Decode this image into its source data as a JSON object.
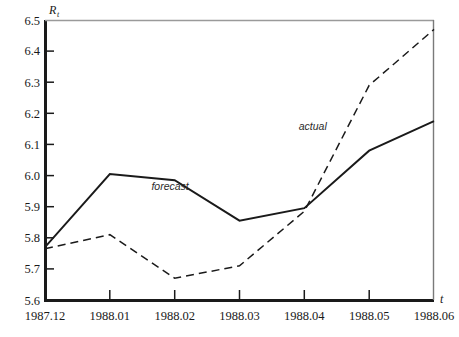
{
  "chart_data": {
    "type": "line",
    "title": "",
    "xlabel": "t",
    "ylabel": "R",
    "ylabel_sub": "t",
    "ylim": [
      5.6,
      6.5
    ],
    "ytick_step": 0.1,
    "grid": false,
    "legend_position": "inline-annotation",
    "categories": [
      "1987.12",
      "1988.01",
      "1988.02",
      "1988.03",
      "1988.04",
      "1988.05",
      "1988.06"
    ],
    "yticks": [
      "6.5",
      "6.4",
      "6.3",
      "6.2",
      "6.1",
      "6.0",
      "5.9",
      "5.8",
      "5.7",
      "5.6"
    ],
    "ytick_values": [
      6.5,
      6.4,
      6.3,
      6.2,
      6.1,
      6.0,
      5.9,
      5.8,
      5.7,
      5.6
    ],
    "series": [
      {
        "name": "forecast",
        "style": "solid",
        "color": "#1a1a1a",
        "values": [
          5.77,
          6.005,
          5.985,
          5.855,
          5.895,
          6.08,
          6.175
        ],
        "annotation": "forecast",
        "annotation_at": {
          "x": 1.93,
          "y": 5.955
        }
      },
      {
        "name": "actual",
        "style": "dashed",
        "color": "#1a1a1a",
        "values": [
          5.765,
          5.81,
          5.67,
          5.71,
          5.885,
          6.29,
          6.47
        ],
        "annotation": "actual",
        "annotation_at": {
          "x": 4.13,
          "y": 6.145
        }
      }
    ]
  },
  "axes": {
    "y_axis_name": "R",
    "y_axis_subscript": "t",
    "x_axis_name": "t",
    "frame_color": "#1a1a1a",
    "top_frame_color": "#9a9a9a",
    "right_frame_color": "#7a7a7a"
  }
}
